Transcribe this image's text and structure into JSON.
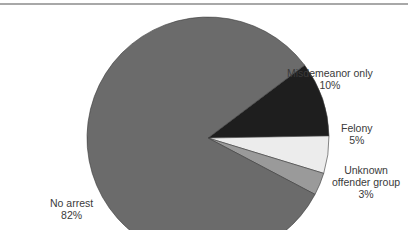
{
  "chart_data": {
    "type": "pie",
    "title": "",
    "slices": [
      {
        "label": "No arrest",
        "value": 82,
        "display": "82%",
        "color": "#6b6b6b"
      },
      {
        "label": "Misdemeanor only",
        "value": 10,
        "display": "10%",
        "color": "#1e1e1e"
      },
      {
        "label": "Felony",
        "value": 5,
        "display": "5%",
        "color": "#ececec"
      },
      {
        "label": "Unknown offender group",
        "value": 3,
        "display": "3%",
        "color": "#9a9a9a"
      }
    ],
    "legend": "none (direct labels)"
  },
  "labels": {
    "no_arrest": {
      "name": "No arrest",
      "pct": "82%"
    },
    "misdemeanor": {
      "name": "Misdemeanor only",
      "pct": "10%"
    },
    "felony": {
      "name": "Felony",
      "pct": "5%"
    },
    "unknown": {
      "line1": "Unknown",
      "line2": "offender group",
      "pct": "3%"
    }
  }
}
